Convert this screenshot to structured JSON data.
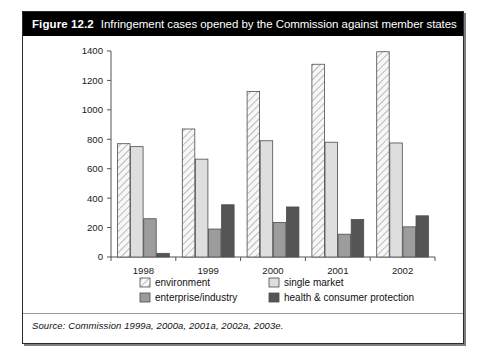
{
  "figure": {
    "number": "Figure 12.2",
    "title": "Infringement cases opened by the Commission against member states",
    "source": "Source: Commission 1999a, 2000a, 2001a, 2002a, 2003e."
  },
  "chart_data": {
    "type": "bar",
    "title": "Infringement cases opened by the Commission against member states",
    "xlabel": "",
    "ylabel": "",
    "categories": [
      "1998",
      "1999",
      "2000",
      "2001",
      "2002"
    ],
    "ylim": [
      0,
      1400
    ],
    "yticks": [
      0,
      200,
      400,
      600,
      800,
      1000,
      1200,
      1400
    ],
    "grid": false,
    "legend_position": "bottom",
    "series": [
      {
        "name": "environment",
        "values": [
          770,
          870,
          1125,
          1310,
          1395
        ],
        "color": "#f2f2f2",
        "pattern": "diagonal-hatch"
      },
      {
        "name": "single market",
        "values": [
          750,
          665,
          790,
          780,
          775
        ],
        "color": "#dedede",
        "pattern": "solid"
      },
      {
        "name": "enterprise/industry",
        "values": [
          260,
          190,
          235,
          155,
          205
        ],
        "color": "#9c9c9c",
        "pattern": "solid"
      },
      {
        "name": "health & consumer protection",
        "values": [
          25,
          355,
          340,
          255,
          280
        ],
        "color": "#555555",
        "pattern": "solid"
      }
    ]
  },
  "axis": {
    "ytick_labels": [
      "1400",
      "1200",
      "1000",
      "800",
      "600",
      "400",
      "200",
      "0"
    ],
    "xtick_labels": [
      "1998",
      "1999",
      "2000",
      "2001",
      "2002"
    ]
  },
  "legend": {
    "items": [
      {
        "label": "environment",
        "swatch": "hatched-swatch"
      },
      {
        "label": "single market",
        "swatch": "light-gray-swatch"
      },
      {
        "label": "enterprise/industry",
        "swatch": "mid-gray-swatch"
      },
      {
        "label": "health & consumer protection",
        "swatch": "dark-gray-swatch"
      }
    ]
  }
}
